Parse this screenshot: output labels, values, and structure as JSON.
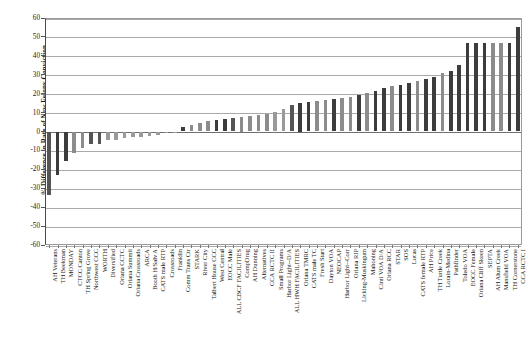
{
  "chart_data": {
    "type": "bar",
    "title": "",
    "xlabel": "",
    "ylabel": "% Difference in Rate of New Felony Conviction",
    "ylim": [
      -60,
      60
    ],
    "ytick_labels": [
      "60",
      "50",
      "40",
      "30",
      "20",
      "10",
      "0",
      "-10",
      "-20",
      "-30",
      "-40",
      "-50",
      "-60"
    ],
    "ytick_values": [
      60,
      50,
      40,
      30,
      20,
      10,
      0,
      -10,
      -20,
      -30,
      -40,
      -50,
      -60
    ],
    "grid": true,
    "legend": "none",
    "categories": [
      "AH Veterans",
      "TH Beekman",
      "MONDAY",
      "CTCC Canton",
      "TH Spring Grove",
      "Northwest CCC",
      "WORTH",
      "Diversified",
      "Oriana CCTC",
      "Oriana Summit",
      "Oriana Crossroads",
      "ARCA",
      "Booth H/Salv A",
      "CATS male RTP",
      "Crossroads",
      "Franklin",
      "Comm Trans Ctr",
      "STARK",
      "River City",
      "Talbert House CCC",
      "West Central",
      "EOCC Male",
      "ALL CBCF FACILITIES",
      "CompDrug",
      "AH Dunning",
      "Alternatives",
      "CCA RCTC II",
      "Small Programs",
      "Harbor Light--D/A",
      "ALL HWH FACILITIES",
      "Oriana TMRC",
      "CATS male TC",
      "Fresh Start",
      "Dayton VOA",
      "NEOCAP",
      "Harbor Light--Corr",
      "Oriana RIP",
      "Licking-Muskingum",
      "Mahoning",
      "Cinti VOA D/A",
      "Oriana RCC",
      "STAR",
      "SOS",
      "Lucas",
      "CATS female RTP",
      "AH Price",
      "TH Turtle Creek",
      "Lorain-Medina",
      "Pathfinder",
      "Toledo VOA",
      "EOCC Female",
      "Oriana Cliff Skeen",
      "SEPTA",
      "AH Alum Creek",
      "Mansfield VOA",
      "TH Cornerstone",
      "CCA RCTC I"
    ],
    "values": [
      -33.5,
      -23.0,
      -15.8,
      -11.3,
      -8.5,
      -6.5,
      -6.5,
      -4.3,
      -4.3,
      -3.2,
      -3.0,
      -3.0,
      -2.5,
      -2.0,
      -1.0,
      -0.5,
      2.5,
      3.5,
      4.5,
      5.5,
      6.0,
      6.5,
      7.0,
      7.5,
      8.0,
      8.5,
      9.0,
      10.5,
      12.0,
      14.0,
      15.0,
      15.5,
      16.0,
      16.5,
      17.0,
      17.5,
      18.5,
      19.5,
      20.5,
      21.5,
      23.0,
      24.0,
      24.5,
      25.5,
      26.5,
      27.5,
      29.0,
      31.0,
      32.0,
      35.0,
      47.0,
      47.0,
      47.0,
      47.0,
      47.0,
      47.0,
      55.0
    ],
    "bar_colors": [
      "#555555",
      "#3c3c3c",
      "#3c3c3c",
      "#8c8c8c",
      "#8c8c8c",
      "#555555",
      "#555555",
      "#9a9a9a",
      "#9a9a9a",
      "#9a9a9a",
      "#9a9a9a",
      "#9a9a9a",
      "#9a9a9a",
      "#9a9a9a",
      "#9a9a9a",
      "#9a9a9a",
      "#3c3c3c",
      "#8c8c8c",
      "#8c8c8c",
      "#8c8c8c",
      "#3c3c3c",
      "#3c3c3c",
      "#555555",
      "#8c8c8c",
      "#8c8c8c",
      "#8c8c8c",
      "#8c8c8c",
      "#9a9a9a",
      "#9a9a9a",
      "#555555",
      "#3c3c3c",
      "#3c3c3c",
      "#8c8c8c",
      "#8c8c8c",
      "#3c3c3c",
      "#8c8c8c",
      "#8c8c8c",
      "#3c3c3c",
      "#8c8c8c",
      "#3c3c3c",
      "#3c3c3c",
      "#8c8c8c",
      "#3c3c3c",
      "#3c3c3c",
      "#8c8c8c",
      "#3c3c3c",
      "#3c3c3c",
      "#8c8c8c",
      "#3c3c3c",
      "#3c3c3c",
      "#3c3c3c",
      "#3c3c3c",
      "#3c3c3c",
      "#8c8c8c",
      "#8c8c8c",
      "#3c3c3c",
      "#3c3c3c"
    ]
  }
}
